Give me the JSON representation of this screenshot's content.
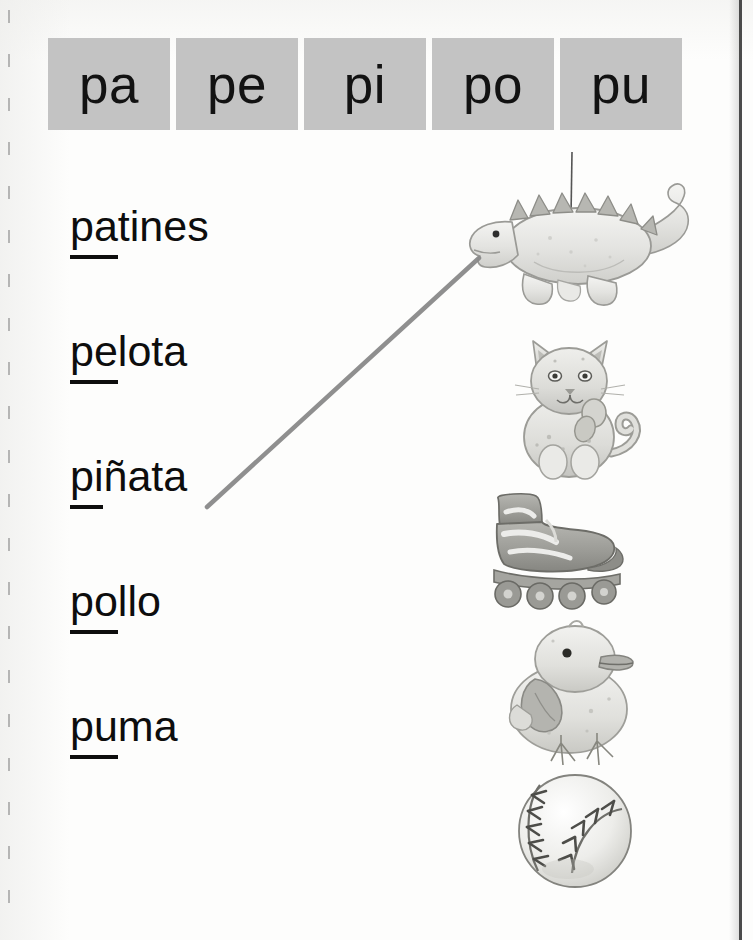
{
  "worksheet": {
    "language": "es",
    "syllable_header": {
      "boxes": [
        {
          "label": "pa"
        },
        {
          "label": "pe"
        },
        {
          "label": "pi"
        },
        {
          "label": "po"
        },
        {
          "label": "pu"
        }
      ],
      "box_fill_color": "#c3c3c3",
      "text_color": "#121212"
    },
    "words": [
      {
        "syllable": "pa",
        "rest": "tines",
        "full": "patines"
      },
      {
        "syllable": "pe",
        "rest": "lota",
        "full": "pelota"
      },
      {
        "syllable": "pi",
        "rest": "ñata",
        "full": "piñata"
      },
      {
        "syllable": "po",
        "rest": "llo",
        "full": "pollo"
      },
      {
        "syllable": "pu",
        "rest": "ma",
        "full": "puma"
      }
    ],
    "illustrations": [
      {
        "name": "pinata-dinosaur-image",
        "alt": "piñata de dinosaurio colgando de un hilo"
      },
      {
        "name": "kitten-cub-image",
        "alt": "gatito / cachorro de puma sentado"
      },
      {
        "name": "roller-skate-image",
        "alt": "patín en línea"
      },
      {
        "name": "chick-image",
        "alt": "pollito"
      },
      {
        "name": "baseball-image",
        "alt": "pelota de béisbol"
      }
    ],
    "match_line": {
      "from_word": "piñata",
      "to_illustration": "pinata-dinosaur-image",
      "color": "#8a8a8a",
      "x1": 207,
      "y1": 507,
      "x2": 479,
      "y2": 258
    }
  }
}
